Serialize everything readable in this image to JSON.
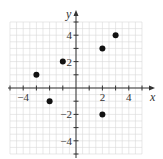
{
  "chart_data": {
    "type": "scatter",
    "title": "",
    "xlabel": "x",
    "ylabel": "y",
    "xlim": [
      -5,
      5
    ],
    "ylim": [
      -5,
      5
    ],
    "grid": true,
    "x_ticks": [
      -4,
      2,
      4
    ],
    "x_tick_labels": [
      "−4",
      "2",
      "4"
    ],
    "y_ticks": [
      4,
      2,
      -2,
      -4
    ],
    "y_tick_labels": [
      "4",
      "2",
      "−2",
      "−4"
    ],
    "series": [
      {
        "name": "points",
        "points": [
          {
            "x": -3,
            "y": 1
          },
          {
            "x": -2,
            "y": -1
          },
          {
            "x": -1,
            "y": 2
          },
          {
            "x": 2,
            "y": 3
          },
          {
            "x": 3,
            "y": 4
          },
          {
            "x": 2,
            "y": -2
          }
        ]
      }
    ]
  }
}
